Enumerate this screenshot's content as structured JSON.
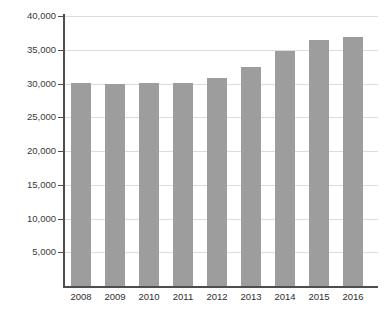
{
  "chart_data": {
    "type": "bar",
    "title": "",
    "xlabel": "",
    "ylabel": "",
    "categories": [
      "2008",
      "2009",
      "2010",
      "2011",
      "2012",
      "2013",
      "2014",
      "2015",
      "2016"
    ],
    "values": [
      30100,
      29900,
      30100,
      30100,
      30800,
      32400,
      34800,
      36500,
      36900
    ],
    "ylim": [
      0,
      40000
    ],
    "yticks": [
      5000,
      10000,
      15000,
      20000,
      25000,
      30000,
      35000,
      40000
    ],
    "ytick_labels": [
      "5,000",
      "10,000",
      "15,000",
      "20,000",
      "25,000",
      "30,000",
      "35,000",
      "40,000"
    ],
    "grid": true,
    "legend": false,
    "series": [
      {
        "name": "",
        "color": "#9d9d9d",
        "values": [
          30100,
          29900,
          30100,
          30100,
          30800,
          32400,
          34800,
          36500,
          36900
        ]
      }
    ]
  },
  "colors": {
    "bar": "#9d9d9d",
    "grid": "#dcdcdc",
    "axis": "#4d4d4d",
    "text": "#2e2e2e",
    "background": "#ffffff"
  }
}
